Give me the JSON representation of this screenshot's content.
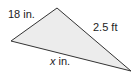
{
  "diagram": {
    "shape": "triangle",
    "fill": "#ececec",
    "stroke": "#333333",
    "vertices": {
      "top": [
        57,
        8
      ],
      "left": [
        11,
        41
      ],
      "right": [
        131,
        71
      ]
    },
    "labels": {
      "left_side": "18 in.",
      "right_side": "2.5 ft",
      "bottom_var": "x",
      "bottom_unit": " in."
    }
  }
}
